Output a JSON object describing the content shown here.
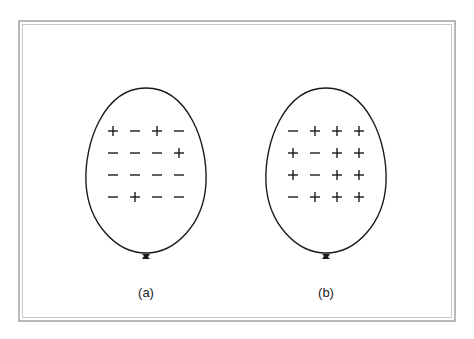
{
  "figure": {
    "balloons": [
      {
        "id": "a",
        "caption": "(a)",
        "cx": 146,
        "charges": [
          [
            "+",
            "−",
            "+",
            "−"
          ],
          [
            "−",
            "−",
            "−",
            "+"
          ],
          [
            "−",
            "−",
            "−",
            "−"
          ],
          [
            "−",
            "+",
            "−",
            "−"
          ]
        ]
      },
      {
        "id": "b",
        "caption": "(b)",
        "cx": 326,
        "charges": [
          [
            "−",
            "+",
            "+",
            "+"
          ],
          [
            "+",
            "−",
            "+",
            "+"
          ],
          [
            "+",
            "−",
            "+",
            "+"
          ],
          [
            "−",
            "+",
            "+",
            "+"
          ]
        ]
      }
    ],
    "colors": {
      "outline": "#1a1a1a",
      "frame": "#b8b8b8",
      "text": "#222222"
    }
  }
}
